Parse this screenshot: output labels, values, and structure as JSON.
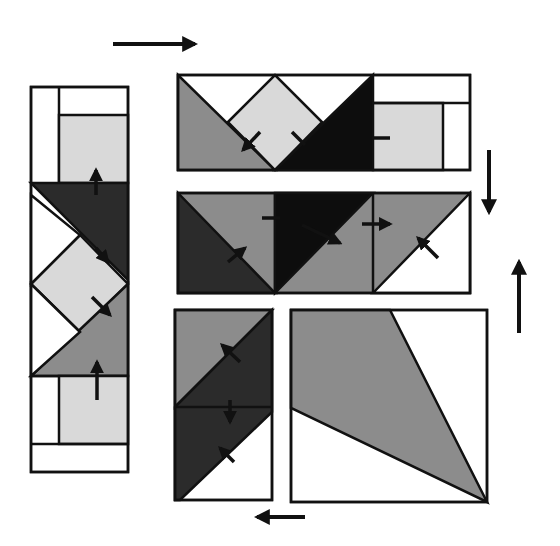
{
  "diagram": {
    "colors": {
      "background": "#ffffff",
      "outline": "#111111",
      "dark": "#2b2b2b",
      "black": "#0d0d0d",
      "medium": "#8c8c8c",
      "light": "#d9d9d9",
      "white": "#ffffff",
      "arrow": "#111111"
    },
    "units": [
      {
        "name": "left-strip-unit",
        "description": "Vertical strip of flying-geese and square-in-a-square units with rectangles at both ends"
      },
      {
        "name": "top-row-unit",
        "description": "Horizontal row: medium triangle, light square-in-a-square, black triangle, light rectangle"
      },
      {
        "name": "middle-row-unit",
        "description": "Horizontal row of three half-square triangle units"
      },
      {
        "name": "bottom-left-unit",
        "description": "Vertical rectangle with diagonal dark and medium bands"
      },
      {
        "name": "bottom-right-unit",
        "description": "Large square with medium kite-shaped triangle"
      }
    ],
    "pressing_arrows": [
      {
        "name": "arrow-top-right",
        "direction": "right"
      },
      {
        "name": "arrow-right-down",
        "direction": "down"
      },
      {
        "name": "arrow-right-up",
        "direction": "up"
      },
      {
        "name": "arrow-bottom-left",
        "direction": "left"
      }
    ]
  }
}
